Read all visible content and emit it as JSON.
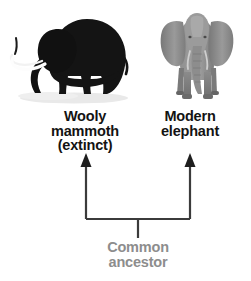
{
  "diagram": {
    "type": "evolutionary-relationship-diagram",
    "background_color": "#ffffff",
    "mammoth": {
      "icon_name": "wooly-mammoth-silhouette",
      "body_color": "#151515",
      "tusk_color": "#fdfdfd",
      "shadow_color": "#e8e8e8",
      "label_lines": [
        "Wooly",
        "mammoth",
        "(extinct)"
      ],
      "label_color": "#131313"
    },
    "elephant": {
      "icon_name": "modern-elephant-photo",
      "body_color": "#8a8a8a",
      "shade_color": "#6d6d6d",
      "highlight_color": "#a8a8a8",
      "label_lines": [
        "Modern",
        "elephant"
      ],
      "label_color": "#131313"
    },
    "bracket": {
      "icon_name": "common-ancestor-bracket",
      "line_color": "#3b3b3b",
      "left_arrow_name": "arrow-up-to-mammoth",
      "right_arrow_name": "arrow-up-to-elephant",
      "stem_name": "ancestor-stem"
    },
    "ancestor": {
      "label_lines": [
        "Common",
        "ancestor"
      ],
      "label_color": "#8d8d8d"
    }
  }
}
